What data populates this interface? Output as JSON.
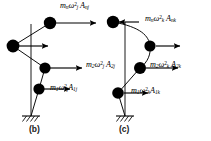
{
  "figure": {
    "background_color": "#ffffff",
    "ink_color": "#000000",
    "panels": [
      {
        "id": "panel-b",
        "caption": "(b)",
        "caption_pos": {
          "x": 29,
          "y": 124
        },
        "axis": {
          "x": 31,
          "y_top": 24,
          "y_bottom": 116
        },
        "support": {
          "x": 31,
          "y": 116,
          "type": "fixed-hatched-ground"
        },
        "nodes": [
          {
            "id": "node-1",
            "name": "mass-1",
            "x": 39,
            "y": 89,
            "r": 5.6
          },
          {
            "id": "node-2",
            "name": "mass-2",
            "x": 45,
            "y": 68,
            "r": 5.6
          },
          {
            "id": "node-3",
            "name": "mass-n-lower",
            "x": 13,
            "y": 46,
            "r": 6.4
          },
          {
            "id": "node-4",
            "name": "mass-n",
            "x": 50,
            "y": 23,
            "r": 6.2
          }
        ],
        "forces": [
          {
            "id": "force-n-b",
            "name": "force-arrow-mass-n",
            "from_x": 56,
            "to_x": 96,
            "y": 23,
            "direction": "right",
            "label": {
              "m": "m",
              "m_sub": "n",
              "omega": "ω",
              "omega_sub": "j",
              "omega_sup": "2",
              "A": "A",
              "A_sub": "nj"
            },
            "label_pos": {
              "x": 60,
              "y": 2
            }
          },
          {
            "id": "force-2-b",
            "name": "force-arrow-mass-2",
            "from_x": 50,
            "to_x": 82,
            "y": 68,
            "direction": "right",
            "label": {
              "m": "m",
              "m_sub": "2",
              "omega": "ω",
              "omega_sub": "j",
              "omega_sup": "2",
              "A": "A",
              "A_sub": "2j"
            },
            "label_pos": {
              "x": 86,
              "y": 61
            }
          },
          {
            "id": "force-1-b",
            "name": "force-arrow-mass-1",
            "from_x": 44,
            "to_x": 70,
            "y": 89,
            "direction": "right",
            "label": {
              "m": "m",
              "m_sub": "1",
              "omega": "ω",
              "omega_sub": "j",
              "omega_sup": "2",
              "A": "A",
              "A_sub": "1j"
            },
            "label_pos": {
              "x": 50,
              "y": 84
            }
          },
          {
            "id": "force-nl-b",
            "name": "force-arrow-mass-n-lower",
            "from_x": 19,
            "to_x": 48,
            "y": 46,
            "direction": "right",
            "label": null,
            "label_pos": null
          }
        ]
      },
      {
        "id": "panel-c",
        "caption": "(c)",
        "caption_pos": {
          "x": 119,
          "y": 124
        },
        "axis": {
          "x": 125,
          "y_top": 22,
          "y_bottom": 116
        },
        "support": {
          "x": 125,
          "y": 116,
          "type": "fixed-hatched-ground"
        },
        "nodes": [
          {
            "id": "node-1",
            "name": "mass-1",
            "x": 118,
            "y": 93,
            "r": 5.8
          },
          {
            "id": "node-2",
            "name": "mass-2",
            "x": 140,
            "y": 68,
            "r": 6.0
          },
          {
            "id": "node-3",
            "name": "mass-mid",
            "x": 150,
            "y": 46,
            "r": 5.6
          },
          {
            "id": "node-4",
            "name": "mass-n",
            "x": 113,
            "y": 22,
            "r": 6.2
          }
        ],
        "forces": [
          {
            "id": "force-n-c",
            "name": "force-arrow-mass-n",
            "from_x": 139,
            "to_x": 119,
            "y": 22,
            "direction": "left",
            "label": {
              "m": "m",
              "m_sub": "n",
              "omega": "ω",
              "omega_sub": "k",
              "omega_sup": "2",
              "A": "A",
              "A_sub": "nk"
            },
            "label_pos": {
              "x": 145,
              "y": 15
            }
          },
          {
            "id": "force-mid-c",
            "name": "force-arrow-mass-mid",
            "from_x": 156,
            "to_x": 180,
            "y": 46,
            "direction": "right",
            "label": null,
            "label_pos": null
          },
          {
            "id": "force-2-c",
            "name": "force-arrow-mass-2",
            "from_x": 146,
            "to_x": 178,
            "y": 68,
            "direction": "right",
            "label": {
              "m": "m",
              "m_sub": "2",
              "omega": "ω",
              "omega_sub": "k",
              "omega_sup": "2",
              "A": "A",
              "A_sub": "2k"
            },
            "label_pos": {
              "x": 150,
              "y": 61
            }
          },
          {
            "id": "force-1-c",
            "name": "force-arrow-mass-1",
            "from_x": 124,
            "to_x": 148,
            "y": 93,
            "direction": "right",
            "label": {
              "m": "m",
              "m_sub": "1",
              "omega": "ω",
              "omega_sub": "k",
              "omega_sup": "2",
              "A": "A",
              "A_sub": "1k"
            },
            "label_pos": {
              "x": 131,
              "y": 87
            }
          }
        ]
      }
    ],
    "labels": {
      "b_n": "m n ω j 2 A nj",
      "b_2": "m 2 ω j 2 A 2j",
      "b_1": "m 1 ω j 2 A 1j",
      "c_n": "m n ω k 2 A nk",
      "c_2": "m 2 ω k 2 A 2k",
      "c_1": "m 1 ω k 2 A 1k"
    }
  }
}
